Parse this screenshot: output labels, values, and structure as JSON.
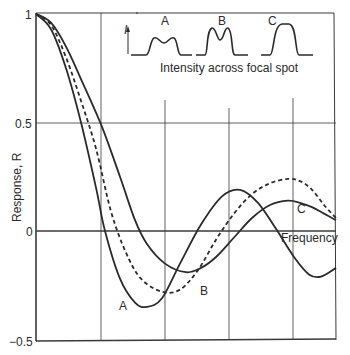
{
  "chart_data": {
    "type": "line",
    "title": "",
    "xlabel": "Frequency",
    "ylabel": "Response, R",
    "ylim": [
      -0.5,
      1
    ],
    "xlim": [
      0,
      1
    ],
    "y_ticks": [
      {
        "value": 1,
        "label": "1"
      },
      {
        "value": 0.5,
        "label": "0.5"
      },
      {
        "value": 0,
        "label": "0"
      },
      {
        "value": -0.5,
        "label": "−0.5"
      }
    ],
    "x_ticks_unlabeled": [
      0.217,
      0.43,
      0.643,
      0.857
    ],
    "grid": true,
    "legend": "inline curve labels",
    "series": [
      {
        "name": "A",
        "style": "solid",
        "x": [
          0,
          0.05,
          0.1,
          0.15,
          0.2,
          0.23,
          0.28,
          0.33,
          0.37,
          0.42,
          0.48,
          0.55,
          0.62,
          0.68,
          0.74,
          0.8,
          0.86,
          0.91,
          0.95,
          1.0
        ],
        "y": [
          1.0,
          0.93,
          0.75,
          0.5,
          0.2,
          0.0,
          -0.22,
          -0.33,
          -0.35,
          -0.31,
          -0.15,
          0.03,
          0.16,
          0.19,
          0.13,
          0.01,
          -0.12,
          -0.2,
          -0.21,
          -0.17
        ]
      },
      {
        "name": "B",
        "style": "dashed",
        "x": [
          0,
          0.05,
          0.1,
          0.15,
          0.2,
          0.25,
          0.3,
          0.35,
          0.42,
          0.48,
          0.54,
          0.6,
          0.66,
          0.72,
          0.78,
          0.84,
          0.88,
          0.92,
          0.96,
          1.0
        ],
        "y": [
          1.0,
          0.95,
          0.8,
          0.6,
          0.38,
          0.09,
          -0.1,
          -0.22,
          -0.28,
          -0.27,
          -0.18,
          -0.04,
          0.08,
          0.17,
          0.22,
          0.24,
          0.23,
          0.19,
          0.12,
          0.06
        ]
      },
      {
        "name": "C",
        "style": "solid",
        "x": [
          0,
          0.05,
          0.1,
          0.15,
          0.22,
          0.28,
          0.33,
          0.37,
          0.43,
          0.5,
          0.55,
          0.6,
          0.66,
          0.72,
          0.78,
          0.84,
          0.88,
          0.92,
          0.96,
          1.0
        ],
        "y": [
          1.0,
          0.96,
          0.85,
          0.7,
          0.48,
          0.25,
          0.05,
          -0.06,
          -0.15,
          -0.19,
          -0.17,
          -0.12,
          -0.03,
          0.06,
          0.12,
          0.14,
          0.13,
          0.11,
          0.08,
          0.05
        ]
      }
    ],
    "annotations": [
      {
        "text": "A",
        "near_series": "A",
        "position": "below curve minimum"
      },
      {
        "text": "B",
        "near_series": "B",
        "position": "right of curve minimum"
      },
      {
        "text": "C",
        "near_series": "C",
        "position": "above curve near right end"
      },
      {
        "text": "Frequency",
        "position": "x-axis label at right end of zero line"
      }
    ],
    "inset": {
      "title": "Intensity across focal spot",
      "axis_label": "I",
      "profiles": [
        {
          "label": "A",
          "shape": "broad with shallow central dip"
        },
        {
          "label": "B",
          "shape": "narrow with pronounced twin peaks"
        },
        {
          "label": "C",
          "shape": "flat-topped"
        }
      ]
    }
  },
  "labels": {
    "y_axis": "Response, R",
    "x_axis": "Frequency",
    "tick_1": "1",
    "tick_05": "0.5",
    "tick_0": "0",
    "tick_m05": "−0.5",
    "curve_a": "A",
    "curve_b": "B",
    "curve_c": "C",
    "inset_caption": "Intensity across focal spot",
    "inset_axis": "I",
    "inset_a": "A",
    "inset_b": "B",
    "inset_c": "C"
  },
  "colors": {
    "ink": "#2a2a2a",
    "grid": "#4a4a4a",
    "background": "#ffffff"
  }
}
